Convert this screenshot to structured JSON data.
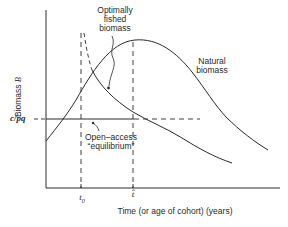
{
  "diagram": {
    "y_axis_label": "Biomass",
    "y_axis_symbol": "B",
    "x_axis_label": "Time (or age of cohort) (years)",
    "y_tick_label": "c/pq",
    "x_tick_t0_label": "t",
    "x_tick_t0_sub": "0",
    "x_tick_that_label": "t̂",
    "curve_labels": {
      "optimally_fished_line1": "Optimally",
      "optimally_fished_line2": "fished",
      "optimally_fished_line3": "biomass",
      "natural_line1": "Natural",
      "natural_line2": "biomass",
      "open_access_line1": "Open–access",
      "open_access_line2": "“equilibrium”"
    },
    "colors": {
      "ink": "#2a2a2a",
      "background": "#ffffff"
    }
  }
}
